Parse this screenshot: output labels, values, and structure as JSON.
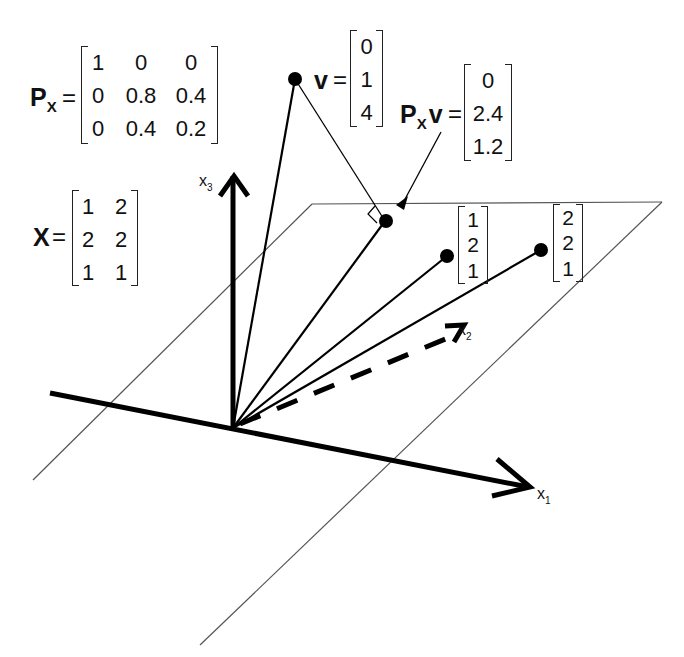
{
  "projection_matrix": {
    "symbol": "P",
    "subscript": "X",
    "equals": "=",
    "rows": [
      [
        "1",
        "0",
        "0"
      ],
      [
        "0",
        "0.8",
        "0.4"
      ],
      [
        "0",
        "0.4",
        "0.2"
      ]
    ]
  },
  "design_matrix": {
    "symbol": "X",
    "equals": "=",
    "rows": [
      [
        "1",
        "2"
      ],
      [
        "2",
        "2"
      ],
      [
        "1",
        "1"
      ]
    ]
  },
  "vector_v": {
    "symbol": "v",
    "equals": "=",
    "values": [
      "0",
      "1",
      "4"
    ]
  },
  "projected_v": {
    "symbol_p": "P",
    "subscript": "X",
    "symbol_v": "v",
    "equals": "=",
    "values": [
      "0",
      "2.4",
      "1.2"
    ]
  },
  "column_1": {
    "values": [
      "1",
      "2",
      "1"
    ]
  },
  "column_2": {
    "values": [
      "2",
      "2",
      "1"
    ]
  },
  "axes": {
    "x1": {
      "base": "x",
      "sub": "1"
    },
    "x2": {
      "base": "x",
      "sub": "2"
    },
    "x3": {
      "base": "x",
      "sub": "3"
    }
  }
}
